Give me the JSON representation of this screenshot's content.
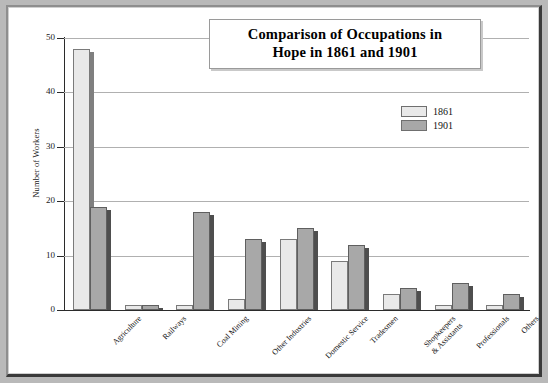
{
  "chart_data": {
    "type": "bar",
    "title": "Comparison of Occupations in Hope in 1861 and 1901",
    "title_lines": [
      "Comparison of Occupations in",
      "Hope in 1861 and 1901"
    ],
    "xlabel": "",
    "ylabel": "Number of Workers",
    "ylim": [
      0,
      50
    ],
    "y_ticks": [
      0,
      10,
      20,
      30,
      40,
      50
    ],
    "grid": true,
    "legend_position": "top-right",
    "categories": [
      "Agriculture",
      "Railways",
      "Coal Mining",
      "Other Industries",
      "Domestic Service",
      "Tradesmen",
      "Shopkeepers\n& Assistants",
      "Professionals",
      "Others"
    ],
    "series": [
      {
        "name": "1861",
        "color": "#e9e9e9",
        "values": [
          48,
          1,
          1,
          2,
          13,
          9,
          3,
          1,
          1
        ]
      },
      {
        "name": "1901",
        "color": "#a8a8a8",
        "values": [
          19,
          1,
          18,
          13,
          15,
          12,
          4,
          5,
          3
        ]
      }
    ]
  },
  "colors": {
    "series_1861": "#e9e9e9",
    "series_1901": "#a8a8a8",
    "plot_background": "#ffffff",
    "gridline": "#b0b0b0",
    "axis": "#2b2b2b",
    "page_background": "#b9b9b9"
  }
}
